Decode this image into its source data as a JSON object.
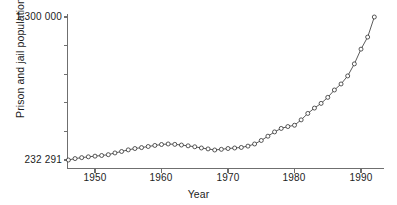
{
  "chart_data": {
    "type": "line",
    "title": "",
    "subtitle": "",
    "xlabel": "Year",
    "ylabel": "Prison and jail population",
    "grid": false,
    "legend": null,
    "marker": "open-circle",
    "xlim": [
      1945.5,
      1992.8
    ],
    "ylim": [
      232291,
      1300000
    ],
    "xticks": [
      1950,
      1960,
      1970,
      1980,
      1990
    ],
    "xtick_labels": [
      "1950",
      "1960",
      "1970",
      "1980",
      "1990"
    ],
    "yticks": [
      232291,
      1300000
    ],
    "ytick_labels": [
      "232 291",
      "1 300 000"
    ],
    "y_minor_tick_count": 4,
    "annotations": [],
    "series": [
      {
        "name": "Prison and jail population",
        "x": [
          1946,
          1947,
          1948,
          1949,
          1950,
          1951,
          1952,
          1953,
          1954,
          1955,
          1956,
          1957,
          1958,
          1959,
          1960,
          1961,
          1962,
          1963,
          1964,
          1965,
          1966,
          1967,
          1968,
          1969,
          1970,
          1971,
          1972,
          1973,
          1974,
          1975,
          1976,
          1977,
          1978,
          1979,
          1980,
          1981,
          1982,
          1983,
          1984,
          1985,
          1986,
          1987,
          1988,
          1989,
          1990,
          1991,
          1992
        ],
        "values": [
          232291,
          243000,
          250000,
          256000,
          261000,
          266000,
          272000,
          285000,
          296000,
          308000,
          318000,
          325000,
          333000,
          341000,
          348000,
          352000,
          349000,
          344000,
          338000,
          331000,
          322000,
          315000,
          307000,
          312000,
          318000,
          322000,
          326000,
          336000,
          352000,
          378000,
          410000,
          442000,
          468000,
          482000,
          492000,
          532000,
          580000,
          620000,
          655000,
          700000,
          755000,
          800000,
          860000,
          950000,
          1060000,
          1150000,
          1300000
        ]
      }
    ]
  },
  "axis": {
    "y_top_label": "1 300 000",
    "y_bottom_label": "232 291",
    "y_title": "Prison and jail population",
    "x_title": "Year",
    "x_labels": [
      "1950",
      "1960",
      "1970",
      "1980",
      "1990"
    ]
  },
  "colors": {
    "line": "#3d3d3d",
    "marker_stroke": "#2e2e2e",
    "marker_fill": "#ffffff",
    "axis": "#6f6f6f",
    "text": "#1c1c1c",
    "background": "#ffffff"
  }
}
